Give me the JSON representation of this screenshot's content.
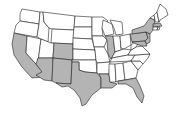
{
  "map": {
    "title": "United States map with highlighted states",
    "colors": {
      "highlighted": "#b4b4b4",
      "default": "#ffffff",
      "border": "#222222"
    },
    "highlighted_states": [
      "CA",
      "AZ",
      "NM",
      "CO",
      "TX",
      "LA",
      "IL",
      "FL",
      "NY",
      "PA",
      "NJ",
      "MD",
      "MA"
    ],
    "states": [
      {
        "id": "WA",
        "points": "22,9 40,12 39,24 20,21 20,14"
      },
      {
        "id": "OR",
        "points": "20,21 39,24 37,37 14,33 16,25"
      },
      {
        "id": "CA",
        "points": "14,33 27,36 26,53 43,72 42,77 32,78 22,67 14,55 12,44"
      },
      {
        "id": "NV",
        "points": "27,36 41,39 38,62 36,64 26,53"
      },
      {
        "id": "ID",
        "points": "40,12 43,12 44,22 49,28 48,42 41,39 37,37 39,24"
      },
      {
        "id": "MT",
        "points": "43,12 75,16 74,30 52,29 49,28 44,22"
      },
      {
        "id": "WY",
        "points": "52,29 74,30 73,44 51,43"
      },
      {
        "id": "UT",
        "points": "41,39 51,43 54,43 53,58 38,58 38,62"
      },
      {
        "id": "AZ",
        "points": "38,58 53,58 52,81 44,80 36,75 42,72 36,64"
      },
      {
        "id": "CO",
        "points": "54,43 73,44 73,60 53,58"
      },
      {
        "id": "NM",
        "points": "53,58 72,60 71,84 56,83 52,81"
      },
      {
        "id": "ND",
        "points": "75,16 92,17 92,27 74,27"
      },
      {
        "id": "SD",
        "points": "74,27 92,27 92,39 73,38"
      },
      {
        "id": "NE",
        "points": "73,38 92,39 95,50 73,49 73,44"
      },
      {
        "id": "KS",
        "points": "73,49 95,50 96,60 73,60"
      },
      {
        "id": "OK",
        "points": "72,60 96,60 97,73 85,72 79,70 79,62 72,62"
      },
      {
        "id": "TX",
        "points": "72,62 79,62 79,70 85,72 97,73 101,78 101,88 92,95 86,104 82,106 80,98 74,90 68,86 62,87 56,83 71,84"
      },
      {
        "id": "MN",
        "points": "92,17 103,17 108,21 102,28 103,36 92,36"
      },
      {
        "id": "IA",
        "points": "92,36 103,36 107,40 104,47 94,47"
      },
      {
        "id": "MO",
        "points": "94,47 104,47 108,54 110,62 97,63 96,60 95,50"
      },
      {
        "id": "AR",
        "points": "97,63 110,62 109,74 99,74 97,73"
      },
      {
        "id": "LA",
        "points": "99,74 109,74 110,82 117,84 112,88 101,88 101,78"
      },
      {
        "id": "WI",
        "points": "103,20 112,24 114,34 105,36 102,28"
      },
      {
        "id": "IL",
        "points": "105,36 113,36 115,52 111,59 108,54 107,40"
      },
      {
        "id": "MI",
        "points": "110,20 122,22 123,34 116,35 114,28"
      },
      {
        "id": "IN",
        "points": "113,36 120,36 121,50 115,52"
      },
      {
        "id": "OH",
        "points": "120,36 130,34 131,45 124,49 121,48"
      },
      {
        "id": "KY",
        "points": "111,59 115,52 121,50 124,49 131,50 128,55 112,58"
      },
      {
        "id": "TN",
        "points": "110,62 112,58 128,55 135,55 131,61"
      },
      {
        "id": "MS",
        "points": "109,64 115,64 116,82 110,82 109,74"
      },
      {
        "id": "AL",
        "points": "115,64 123,63 125,80 118,81 116,82"
      },
      {
        "id": "GA",
        "points": "123,63 131,61 138,70 136,78 125,80"
      },
      {
        "id": "FL",
        "points": "118,81 125,80 136,78 140,86 144,96 142,103 137,97 133,88 126,84 118,84"
      },
      {
        "id": "SC",
        "points": "131,61 140,61 143,64 138,70"
      },
      {
        "id": "NC",
        "points": "131,61 135,55 150,54 148,58 143,64 140,61"
      },
      {
        "id": "VA",
        "points": "128,55 131,50 136,47 142,46 146,50 150,54 135,55"
      },
      {
        "id": "WV",
        "points": "131,45 135,42 138,44 136,47 131,50"
      },
      {
        "id": "PA",
        "points": "130,34 146,32 148,38 145,41 132,42"
      },
      {
        "id": "MD",
        "points": "132,42 145,41 147,46 142,46 136,44"
      },
      {
        "id": "NJ",
        "points": "146,32 150,34 150,42 147,44 145,41 148,38"
      },
      {
        "id": "NY",
        "points": "132,30 144,26 150,18 155,20 153,30 150,34 146,32 132,34"
      },
      {
        "id": "VT",
        "points": "150,18 154,15 155,20"
      },
      {
        "id": "NH",
        "points": "154,15 157,12 159,22 155,22 155,20"
      },
      {
        "id": "ME",
        "points": "157,12 160,4 166,9 168,15 160,20 159,22"
      },
      {
        "id": "MA",
        "points": "153,24 160,23 162,26 153,27"
      },
      {
        "id": "CT",
        "points": "153,27 158,27 157,30 153,30"
      },
      {
        "id": "RI",
        "points": "158,27 160,27 159,30 157,30"
      }
    ]
  }
}
